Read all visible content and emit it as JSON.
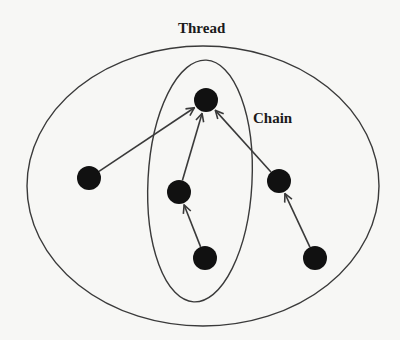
{
  "labels": {
    "thread": "Thread",
    "chain": "Chain"
  },
  "colors": {
    "background": "#f7f7f5",
    "stroke": "#3a3a3a",
    "node": "#111111"
  },
  "diagram": {
    "outer_ellipse": {
      "name": "thread-boundary",
      "cx": 203,
      "cy": 186,
      "rx": 176,
      "ry": 140
    },
    "inner_ellipse": {
      "name": "chain-boundary",
      "cx": 200,
      "cy": 181,
      "rx": 52,
      "ry": 121,
      "rotate": 3
    },
    "label_positions": {
      "thread": {
        "x": 178,
        "y": 20
      },
      "chain": {
        "x": 253,
        "y": 110
      }
    },
    "node_radius": 12,
    "nodes": [
      {
        "id": "root",
        "x": 206,
        "y": 100
      },
      {
        "id": "left",
        "x": 89,
        "y": 178
      },
      {
        "id": "mid",
        "x": 179,
        "y": 192
      },
      {
        "id": "right",
        "x": 279,
        "y": 181
      },
      {
        "id": "bottom-mid",
        "x": 205,
        "y": 258
      },
      {
        "id": "bottom-right",
        "x": 315,
        "y": 258
      }
    ],
    "edges": [
      {
        "from": "left",
        "to": "root"
      },
      {
        "from": "mid",
        "to": "root"
      },
      {
        "from": "right",
        "to": "root"
      },
      {
        "from": "bottom-mid",
        "to": "mid"
      },
      {
        "from": "bottom-right",
        "to": "right"
      }
    ]
  }
}
